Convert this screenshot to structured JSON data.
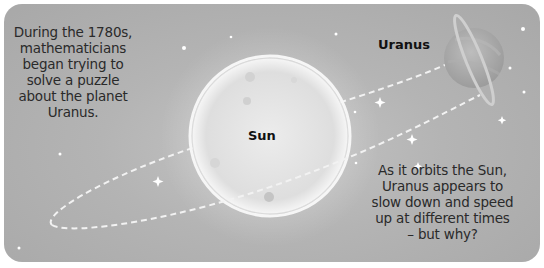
{
  "scene": {
    "background_color": "#b4b4b4",
    "sun_color": "#e6e6e6",
    "orbit_color": "#f2f2f2",
    "planet_color": "#a9a9a9"
  },
  "captions": {
    "intro": "During the 1780s, mathematicians began trying to solve a puzzle about the planet Uranus.",
    "question": "As it orbits the Sun, Uranus appears to slow down and speed up at different times – but why?"
  },
  "labels": {
    "sun": "Sun",
    "uranus": "Uranus"
  },
  "icons": [
    "sun-illustration",
    "orbit-path",
    "uranus-planet-illustration",
    "star-icon"
  ]
}
